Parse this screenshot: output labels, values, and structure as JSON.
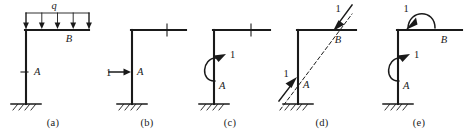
{
  "figure": {
    "background_color": "#ffffff",
    "ink_color": "#1a1a1a",
    "panels": [
      {
        "id": "a",
        "caption": "(a)",
        "description": "frame with uniformly distributed load on beam",
        "labels": {
          "load": "q",
          "beam_node": "B",
          "base_node": "A"
        },
        "load_arrow_count": 5
      },
      {
        "id": "b",
        "caption": "(b)",
        "description": "frame with unit horizontal force at A",
        "labels": {
          "force": "1",
          "base_node": "A"
        }
      },
      {
        "id": "c",
        "caption": "(c)",
        "description": "frame with unit moment at A",
        "labels": {
          "moment": "1",
          "base_node": "A"
        }
      },
      {
        "id": "d",
        "caption": "(d)",
        "description": "frame with unit force pair along diagonal A-B",
        "labels": {
          "force_a": "1",
          "force_b": "1",
          "base_node": "A",
          "beam_node": "B"
        }
      },
      {
        "id": "e",
        "caption": "(e)",
        "description": "frame with unit moment at A and unit moment at B",
        "labels": {
          "moment_top": "1",
          "moment_base": "1",
          "base_node": "A",
          "beam_node": "B"
        }
      }
    ]
  }
}
